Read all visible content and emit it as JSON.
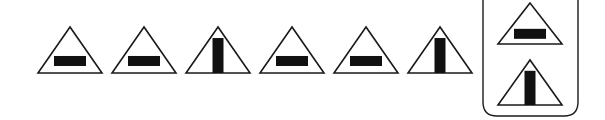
{
  "colors": {
    "stroke": "#1a1a1a",
    "fill": "#111111",
    "background": "#ffffff"
  },
  "sequence": [
    {
      "shape": "triangle",
      "inner": "horizontal-bar",
      "cx": 70
    },
    {
      "shape": "triangle",
      "inner": "horizontal-bar",
      "cx": 144
    },
    {
      "shape": "triangle",
      "inner": "vertical-bar",
      "cx": 218
    },
    {
      "shape": "triangle",
      "inner": "horizontal-bar",
      "cx": 292
    },
    {
      "shape": "triangle",
      "inner": "horizontal-bar",
      "cx": 366
    },
    {
      "shape": "triangle",
      "inner": "vertical-bar",
      "cx": 440
    }
  ],
  "options_box": {
    "items": [
      {
        "shape": "triangle",
        "inner": "horizontal-bar"
      },
      {
        "shape": "triangle",
        "inner": "vertical-bar"
      }
    ]
  }
}
